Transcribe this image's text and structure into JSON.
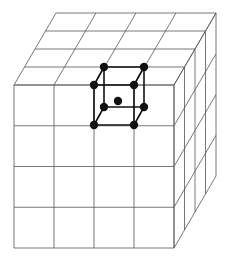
{
  "diagram": {
    "colors": {
      "grid": "#555555",
      "cell": "#111111",
      "background": "#ffffff"
    },
    "block": {
      "divisions": 4,
      "front_face": {
        "x0": 14,
        "y0": 85,
        "x1": 174,
        "y1": 248
      },
      "depth_offset": {
        "dx": 42,
        "dy": -72
      }
    },
    "unit_cell": {
      "front": [
        [
          94,
          85
        ],
        [
          134,
          85
        ],
        [
          94,
          125
        ],
        [
          134,
          125
        ]
      ],
      "back": [
        [
          104,
          67
        ],
        [
          144,
          67
        ],
        [
          104,
          107
        ],
        [
          144,
          107
        ]
      ],
      "center": [
        118,
        101
      ],
      "atom_radius": 4.2
    }
  }
}
